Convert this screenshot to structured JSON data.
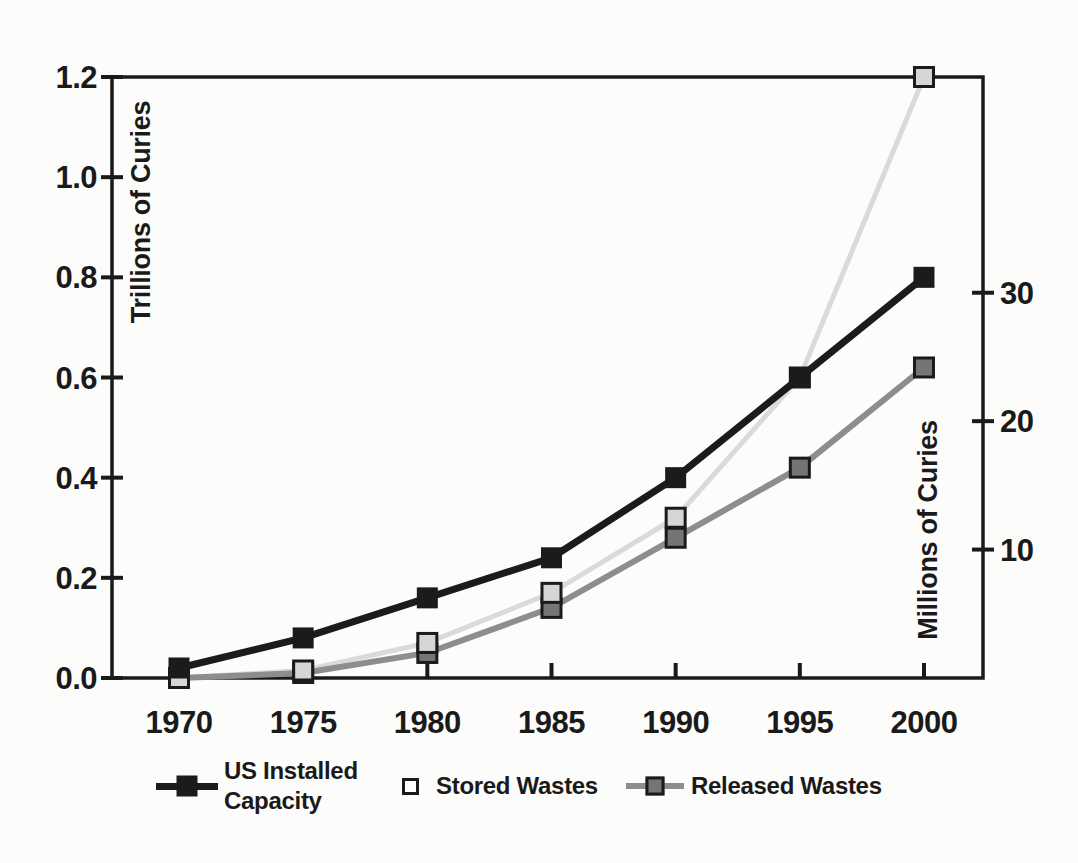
{
  "chart_data": {
    "type": "line",
    "title": "",
    "x": [
      1970,
      1975,
      1980,
      1985,
      1990,
      1995,
      2000
    ],
    "x_tick_labels": [
      "1970",
      "1975",
      "1980",
      "1985",
      "1990",
      "1995",
      "2000"
    ],
    "left_axis": {
      "title": "Trillions of Curies",
      "range": [
        0,
        1.2
      ],
      "ticks": [
        {
          "label": "0.0",
          "value": 0.0
        },
        {
          "label": "0.2",
          "value": 0.2
        },
        {
          "label": "0.4",
          "value": 0.4
        },
        {
          "label": "0.6",
          "value": 0.6
        },
        {
          "label": "0.8",
          "value": 0.8
        },
        {
          "label": "1.0",
          "value": 1.0
        },
        {
          "label": "1.2",
          "value": 1.2
        }
      ]
    },
    "right_axis": {
      "title": "Millions of Curies",
      "range": [
        0,
        46.8
      ],
      "ticks": [
        {
          "label": "10",
          "value": 10
        },
        {
          "label": "20",
          "value": 20
        },
        {
          "label": "30",
          "value": 30
        }
      ]
    },
    "series": [
      {
        "name": "US Installed Capacity",
        "axis": "left",
        "values": [
          0.02,
          0.08,
          0.16,
          0.24,
          0.4,
          0.6,
          0.8
        ],
        "color": "#1b1b1b",
        "marker_color": "#1b1b1b",
        "marker_border": "#1b1b1b",
        "marker_border_width": 0,
        "line_width": 7,
        "marker_size": 21
      },
      {
        "name": "Stored Wastes",
        "axis": "left",
        "values": [
          0.0,
          0.015,
          0.07,
          0.17,
          0.32,
          0.6,
          1.2
        ],
        "color": "#dadada",
        "marker_color": "#d6d6d6",
        "marker_border": "#1b1b1b",
        "marker_border_width": 3,
        "line_width": 5,
        "marker_size": 19
      },
      {
        "name": "Released Wastes",
        "axis": "left",
        "values": [
          0.0,
          0.01,
          0.05,
          0.14,
          0.28,
          0.42,
          0.62
        ],
        "color": "#8d8d8d",
        "marker_color": "#757575",
        "marker_border": "#1b1b1b",
        "marker_border_width": 3,
        "line_width": 6,
        "marker_size": 19
      }
    ],
    "grid": false,
    "legend_position": "bottom",
    "legend": [
      {
        "label": "US Installed Capacity",
        "marker": "black-square-on-line"
      },
      {
        "label": "Stored Wastes",
        "marker": "open-square"
      },
      {
        "label": "Released Wastes",
        "marker": "gray-square-on-line"
      }
    ]
  },
  "colors": {
    "axis": "#1a1a1a",
    "text": "#1a1a1a",
    "background": "#fcfcfb",
    "stored_legend_square_fill": "#ffffff"
  }
}
